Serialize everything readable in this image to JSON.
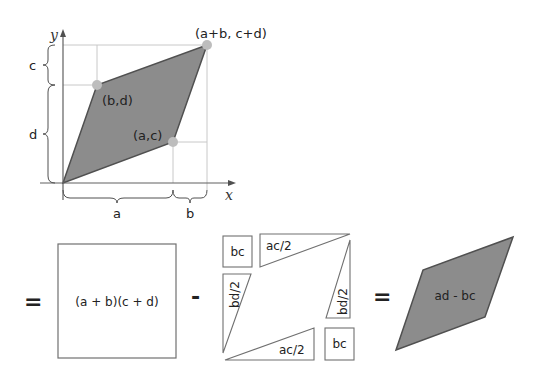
{
  "colors": {
    "fill": "#8c8c8c",
    "edge": "#505050",
    "grid": "#c8c8c8",
    "point": "#bdbdbd",
    "box": "#707070",
    "text": "#222222"
  },
  "top_plot": {
    "axis_x_label": "x",
    "axis_y_label": "y",
    "points": {
      "top_right": "(a+b, c+d)",
      "b_d": "(b,d)",
      "a_c": "(a,c)"
    },
    "braces": {
      "left_top": "c",
      "left_bottom": "d",
      "bottom_left": "a",
      "bottom_right": "b"
    }
  },
  "equation": {
    "eq1": "=",
    "big_square": "(a + b)(c + d)",
    "minus": "-",
    "pieces": {
      "bc_top_left": "bc",
      "ac2_top": "ac/2",
      "bd2_left": "bd/2",
      "bd2_right": "bd/2",
      "ac2_bottom": "ac/2",
      "bc_bottom_right": "bc"
    },
    "eq2": "=",
    "result": "ad - bc"
  }
}
